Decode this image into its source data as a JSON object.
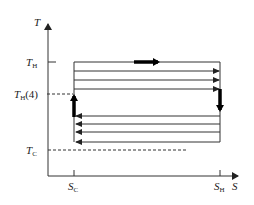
{
  "diagram": {
    "type": "T-S diagram",
    "axes": {
      "y_label": "T",
      "x_label": "S"
    },
    "y_labels": {
      "t_hot": {
        "main": "T",
        "sub": "H",
        "suffix": ""
      },
      "t_hot_4": {
        "main": "T",
        "sub": "H",
        "suffix": "(4)"
      },
      "t_cold": {
        "main": "T",
        "sub": "C",
        "suffix": ""
      }
    },
    "x_labels": {
      "s_cold": {
        "main": "S",
        "sub": "C"
      },
      "s_hot": {
        "main": "S",
        "sub": "H"
      }
    },
    "lines": {
      "right_arrow_count": 3,
      "left_arrow_count": 4,
      "top_line_has_thick_arrow": true,
      "left_thick_segment_direction": "up",
      "right_thick_segment_direction": "down"
    },
    "colors": {
      "line": "#333333",
      "thick": "#000000",
      "background": "#ffffff"
    }
  }
}
